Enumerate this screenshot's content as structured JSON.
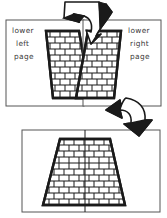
{
  "diagram": {
    "type": "instructional-assembly-diagram",
    "style": "black-and-white line art",
    "colors": {
      "ink": "#1a1a1a",
      "panel_border": "#555555",
      "label_text": "#3a3a3a",
      "brick_fill": "#ffffff",
      "background": "#ffffff"
    }
  },
  "panels": [
    {
      "id": "lower-left-page",
      "label_lines": [
        "lower",
        "left",
        "page"
      ],
      "shape": "half-pyramid-trapezoid",
      "orientation": "right-half",
      "brick_rows": 11
    },
    {
      "id": "lower-right-page",
      "label_lines": [
        "lower",
        "right",
        "page"
      ],
      "shape": "half-pyramid-trapezoid",
      "orientation": "left-half",
      "brick_rows": 11
    },
    {
      "id": "assembled-lower-page",
      "label_lines": [],
      "shape": "full-pyramid-trapezoid",
      "orientation": "centered",
      "brick_rows": 11,
      "has_center_seam": true
    }
  ],
  "arrows": [
    {
      "id": "arrow-join-top",
      "direction": "down-split",
      "from": "top",
      "to": "lower-left-page and lower-right-page inner edges"
    },
    {
      "id": "arrow-to-assembly",
      "direction": "down-left",
      "from": "lower-right-page",
      "to": "assembled-lower-page"
    }
  ]
}
